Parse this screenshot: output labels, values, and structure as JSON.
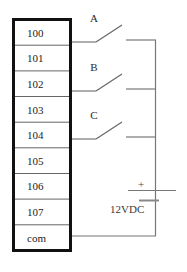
{
  "diagram": {
    "colors": {
      "block_border": "#111111",
      "row_divider": "#555555",
      "wire": "#777777",
      "switch_blade": "#666666",
      "text": "#1c1c1c",
      "background": "#ffffff"
    },
    "terminal_block": {
      "name": "terminal-block",
      "rows": [
        {
          "label": "100",
          "wired": true
        },
        {
          "label": "101",
          "wired": false
        },
        {
          "label": "102",
          "wired": true
        },
        {
          "label": "103",
          "wired": false
        },
        {
          "label": "104",
          "wired": true
        },
        {
          "label": "105",
          "wired": false
        },
        {
          "label": "106",
          "wired": false
        },
        {
          "label": "107",
          "wired": false
        },
        {
          "label": "com",
          "wired": true
        }
      ]
    },
    "switches": [
      {
        "label": "A",
        "terminal": "100"
      },
      {
        "label": "B",
        "terminal": "102"
      },
      {
        "label": "C",
        "terminal": "104"
      }
    ],
    "power_source": {
      "label": "12VDC",
      "polarity": "+"
    }
  }
}
